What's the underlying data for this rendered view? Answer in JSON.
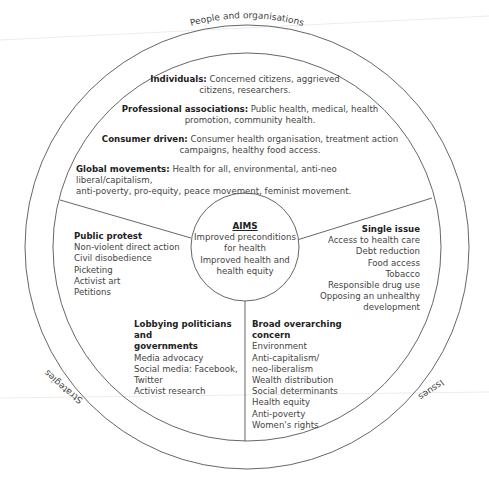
{
  "diagram": {
    "header_fragment": "…",
    "rings": {
      "top_label": "People and organisations",
      "right_label": "Issues",
      "left_label": "Strategies"
    },
    "people": [
      {
        "label": "Individuals:",
        "text": "Concerned citizens, aggrieved",
        "text2": "citizens, researchers."
      },
      {
        "label": "Professional associations:",
        "text": "Public health, medical, health",
        "text2": "promotion, community health."
      },
      {
        "label": "Consumer driven:",
        "text": "Consumer health organisation, treatment action",
        "text2": "campaigns, healthy food access."
      },
      {
        "label": "Global movements:",
        "text": "Health for all, environmental, anti-neo liberal/capitalism,",
        "text2": "anti-poverty, pro-equity, peace movement, feminist movement."
      }
    ],
    "aims": {
      "title": "AIMS",
      "lines": [
        "Improved preconditions",
        "for health",
        "Improved health and",
        "health equity"
      ]
    },
    "public_protest": {
      "title": "Public protest",
      "items": [
        "Non-violent direct action",
        "Civil disobedience",
        "Picketing",
        "Activist art",
        "Petitions"
      ]
    },
    "single_issue": {
      "title": "Single issue",
      "items": [
        "Access to health care",
        "Debt reduction",
        "Food access",
        "Tobacco",
        "Responsible drug use",
        "Opposing an unhealthy",
        "development"
      ]
    },
    "lobbying": {
      "title_line1": "Lobbying politicians and",
      "title_line2": "governments",
      "items": [
        "Media advocacy",
        "Social media: Facebook,",
        "Twitter",
        "Activist research"
      ]
    },
    "broad_concern": {
      "title": "Broad overarching concern",
      "items": [
        "Environment",
        "Anti-capitalism/",
        "neo-liberalism",
        "Wealth distribution",
        "Social determinants",
        "Health equity",
        "Anti-poverty",
        "Women's rights"
      ]
    },
    "colors": {
      "stroke": "#555555",
      "text": "#444444",
      "heading": "#222222",
      "fold_line": "#e6e6e6"
    }
  }
}
